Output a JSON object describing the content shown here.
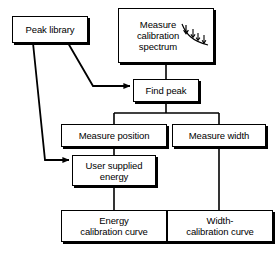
{
  "diagram": {
    "background_color": "#ffffff",
    "line_color": "#000000",
    "box_fill": "#ffffff",
    "nodes": [
      {
        "id": "peak-library",
        "label": "Peak library"
      },
      {
        "id": "measure-spectrum",
        "label": "Measure\ncalibration\nspectrum",
        "icon": "spectrum-sketch-icon"
      },
      {
        "id": "find-peak",
        "label": "Find peak"
      },
      {
        "id": "measure-position",
        "label": "Measure position"
      },
      {
        "id": "measure-width",
        "label": "Measure width"
      },
      {
        "id": "user-energy",
        "label": "User supplied\nenergy"
      },
      {
        "id": "energy-curve",
        "label": "Energy\ncalibration curve"
      },
      {
        "id": "width-curve",
        "label": "Width-\ncalibration curve"
      }
    ],
    "edges": [
      {
        "id": "edge-spectrum-to-find-peak",
        "from": "measure-spectrum",
        "to": "find-peak",
        "arrow": false
      },
      {
        "id": "edge-library-to-find-peak",
        "from": "peak-library",
        "to": "find-peak",
        "arrow": true
      },
      {
        "id": "edge-library-to-user-energy",
        "from": "peak-library",
        "to": "user-energy",
        "arrow": true
      },
      {
        "id": "edge-find-peak-to-position",
        "from": "find-peak",
        "to": "measure-position",
        "arrow": false
      },
      {
        "id": "edge-find-peak-to-width",
        "from": "find-peak",
        "to": "measure-width",
        "arrow": false
      },
      {
        "id": "edge-position-to-user-energy",
        "from": "measure-position",
        "to": "user-energy",
        "arrow": false
      },
      {
        "id": "edge-user-energy-to-energy-curve",
        "from": "user-energy",
        "to": "energy-curve",
        "arrow": false
      },
      {
        "id": "edge-width-to-width-curve",
        "from": "measure-width",
        "to": "width-curve",
        "arrow": false
      }
    ]
  }
}
